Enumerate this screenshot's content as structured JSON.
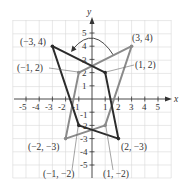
{
  "figure": {
    "axes": {
      "x_label": "x",
      "y_label": "y",
      "x_ticks": [
        -5,
        -4,
        -3,
        -2,
        -1,
        1,
        2,
        3,
        4,
        5
      ],
      "y_ticks": [
        -5,
        -4,
        -3,
        -2,
        -1,
        1,
        2,
        3,
        4,
        5
      ],
      "x_tick_labels": [
        "-5",
        "-4",
        "-3",
        "-2",
        "-1",
        "1",
        "2",
        "3",
        "4",
        "5"
      ],
      "y_tick_labels": [
        "-5",
        "-4",
        "-3",
        "-2",
        "-1",
        "1",
        "2",
        "3",
        "4",
        "5"
      ],
      "range": {
        "x": [
          -6,
          6
        ],
        "y": [
          -6,
          6
        ]
      },
      "grid": true
    },
    "shapes": [
      {
        "name": "original",
        "color": "#2b2b2b",
        "vertices": [
          [
            -3,
            4
          ],
          [
            1,
            2
          ],
          [
            2,
            -3
          ],
          [
            -1,
            -2
          ]
        ]
      },
      {
        "name": "reflected",
        "color": "#8a8a8a",
        "vertices": [
          [
            3,
            4
          ],
          [
            -1,
            2
          ],
          [
            -2,
            -3
          ],
          [
            1,
            -2
          ]
        ]
      }
    ],
    "labels": {
      "p1": "(−3, 4)",
      "p2": "(3, 4)",
      "p3": "(−1, 2)",
      "p4": "(1, 2)",
      "p5": "(−2, −3)",
      "p6": "(2, −3)",
      "p7": "(−1, −2)",
      "p8": "(1, −2)"
    },
    "arrow": {
      "type": "curved",
      "direction": "right-to-left",
      "across": "y-axis"
    },
    "colors": {
      "dark": "#2b2b2b",
      "gray": "#8a8a8a",
      "grid": "#d9d9d9",
      "axis": "#333333"
    }
  }
}
